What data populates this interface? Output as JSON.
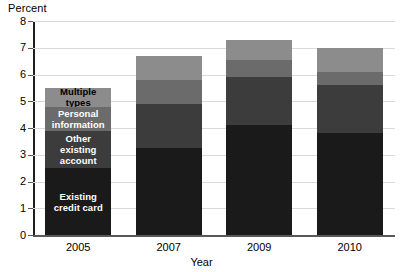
{
  "chart_data": {
    "type": "bar",
    "stacked": true,
    "title": "",
    "xlabel": "Year",
    "ylabel": "Percent",
    "categories": [
      "2005",
      "2007",
      "2009",
      "2010"
    ],
    "ylim": [
      0,
      8
    ],
    "yticks": [
      0,
      1,
      2,
      3,
      4,
      5,
      6,
      7,
      8
    ],
    "ytick_labels": [
      "0",
      "1",
      "2",
      "3",
      "4",
      "5",
      "6",
      "7",
      "8"
    ],
    "grid": true,
    "legend_position": "in-bar-2005",
    "series": [
      {
        "name": "Existing credit card",
        "color": "#1a1a1a",
        "label_color": "#ffffff",
        "values": [
          2.5,
          3.25,
          4.1,
          3.8
        ]
      },
      {
        "name": "Other existing account",
        "color": "#3c3c3c",
        "label_color": "#ffffff",
        "values": [
          1.4,
          1.65,
          1.8,
          1.8
        ]
      },
      {
        "name": "Personal information",
        "color": "#6b6b6b",
        "label_color": "#ffffff",
        "values": [
          0.9,
          0.9,
          0.65,
          0.5
        ]
      },
      {
        "name": "Multiple types",
        "color": "#8c8c8c",
        "label_color": "#000000",
        "values": [
          0.7,
          0.9,
          0.75,
          0.9
        ]
      }
    ],
    "totals": [
      5.5,
      6.7,
      7.3,
      7.0
    ]
  },
  "axes": {
    "y_title": "Percent",
    "x_title": "Year"
  },
  "ticks": {
    "y": [
      "8",
      "7",
      "6",
      "5",
      "4",
      "3",
      "2",
      "1",
      "0"
    ],
    "x": [
      "2005",
      "2007",
      "2009",
      "2010"
    ]
  },
  "legend_labels": {
    "multiple_types": "Multiple types",
    "personal_information": "Personal\ninformation",
    "other_existing_account": "Other existing\naccount",
    "existing_credit_card": "Existing\ncredit card"
  },
  "colors": {
    "existing_credit_card": "#1a1a1a",
    "other_existing_account": "#3c3c3c",
    "personal_information": "#6b6b6b",
    "multiple_types": "#8c8c8c",
    "gridline": "#d8dadb",
    "axis": "#55595c",
    "background": "#ffffff"
  }
}
